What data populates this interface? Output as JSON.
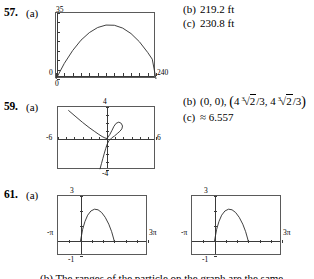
{
  "page": {
    "problems": [
      {
        "number": "57.",
        "part_a_label": "(a)",
        "answers": [
          {
            "label": "(b)",
            "text": "219.2 ft"
          },
          {
            "label": "(c)",
            "text": "230.8 ft"
          }
        ]
      },
      {
        "number": "59.",
        "part_a_label": "(a)",
        "answers": [
          {
            "label": "(b)",
            "prefix": "(0, 0), ",
            "point_open": "(",
            "point_close": ")"
          },
          {
            "label": "(c)",
            "text": "≈ 6.557"
          }
        ],
        "radical_index": "3",
        "radical_radicand": "2",
        "coord_numer": "4",
        "coord_denom": "/3",
        "coord_sep": ", "
      },
      {
        "number": "61.",
        "part_a_label": "(a)"
      }
    ],
    "bottom_note": "(b) The ranges of the particle on the graph are the same."
  },
  "chart_data": [
    {
      "id": "graph-57",
      "type": "line",
      "title": "",
      "xlabel": "",
      "ylabel": "",
      "xlim": [
        0,
        240
      ],
      "ylim": [
        0,
        35
      ],
      "axis_labels": {
        "y_max": "35",
        "y_min": "0",
        "x_min": "0",
        "x_max": "240"
      },
      "grid": false,
      "legend": "none",
      "x_ticks": [
        0,
        20,
        40,
        60,
        80,
        100,
        120,
        140,
        160,
        180,
        200,
        220,
        240
      ],
      "y_ticks": [
        0,
        5,
        10,
        15,
        20,
        25,
        30,
        35
      ],
      "points": [
        {
          "x": 0,
          "y": 0
        },
        {
          "x": 20,
          "y": 8.3
        },
        {
          "x": 40,
          "y": 15.1
        },
        {
          "x": 60,
          "y": 20.6
        },
        {
          "x": 80,
          "y": 24.6
        },
        {
          "x": 100,
          "y": 27.3
        },
        {
          "x": 120,
          "y": 28.6
        },
        {
          "x": 140,
          "y": 28.5
        },
        {
          "x": 160,
          "y": 27.0
        },
        {
          "x": 180,
          "y": 24.1
        },
        {
          "x": 200,
          "y": 19.8
        },
        {
          "x": 220,
          "y": 14.1
        },
        {
          "x": 231,
          "y": 10.5
        },
        {
          "x": 240,
          "y": 0
        }
      ]
    },
    {
      "id": "graph-59",
      "type": "line",
      "title": "",
      "xlabel": "",
      "ylabel": "",
      "xlim": [
        -6,
        6
      ],
      "ylim": [
        -4,
        4
      ],
      "axis_labels": {
        "y_max": "4",
        "y_min": "-4",
        "x_min": "-6",
        "x_max": "6"
      },
      "grid": false,
      "legend": "none",
      "curve_name": "folium of Descartes",
      "branches": [
        {
          "name": "asymptotic-branch",
          "points": [
            {
              "x": -4.7,
              "y": 3.55
            },
            {
              "x": -3.8,
              "y": 2.75
            },
            {
              "x": -3.0,
              "y": 2.05
            },
            {
              "x": -2.2,
              "y": 1.4
            },
            {
              "x": -1.5,
              "y": 0.88
            },
            {
              "x": -1.0,
              "y": 0.52
            },
            {
              "x": -0.6,
              "y": 0.25
            },
            {
              "x": -0.25,
              "y": 0.07
            },
            {
              "x": 0,
              "y": 0
            }
          ]
        },
        {
          "name": "loop-and-tail",
          "points": [
            {
              "x": 0,
              "y": 0
            },
            {
              "x": 0.35,
              "y": 0.52
            },
            {
              "x": 0.62,
              "y": 1.05
            },
            {
              "x": 0.85,
              "y": 1.55
            },
            {
              "x": 1.12,
              "y": 1.93
            },
            {
              "x": 1.45,
              "y": 2.08
            },
            {
              "x": 1.75,
              "y": 1.92
            },
            {
              "x": 1.9,
              "y": 1.58
            },
            {
              "x": 1.82,
              "y": 1.22
            },
            {
              "x": 1.58,
              "y": 0.92
            },
            {
              "x": 1.25,
              "y": 0.62
            },
            {
              "x": 0.92,
              "y": 0.32
            },
            {
              "x": 0.55,
              "y": 0.05
            },
            {
              "x": 0.22,
              "y": -0.3
            },
            {
              "x": 0.02,
              "y": -0.72
            },
            {
              "x": -0.15,
              "y": -1.25
            },
            {
              "x": -0.32,
              "y": -1.85
            },
            {
              "x": -0.5,
              "y": -2.52
            },
            {
              "x": -0.68,
              "y": -3.2
            },
            {
              "x": -0.85,
              "y": -3.85
            }
          ]
        }
      ]
    },
    {
      "id": "graph-61-left",
      "type": "line",
      "title": "",
      "xlabel": "",
      "ylabel": "",
      "xlim": [
        -3.14159,
        9.42478
      ],
      "ylim": [
        -1,
        3
      ],
      "axis_labels": {
        "y_max": "3",
        "y_min": "-1",
        "x_min": "-π",
        "x_max": "3π"
      },
      "grid": false,
      "legend": "none",
      "points": [
        {
          "x": 0.0,
          "y": 0.0
        },
        {
          "x": 0.3,
          "y": 0.78
        },
        {
          "x": 0.62,
          "y": 1.3
        },
        {
          "x": 1.0,
          "y": 1.72
        },
        {
          "x": 1.45,
          "y": 2.0
        },
        {
          "x": 1.95,
          "y": 2.12
        },
        {
          "x": 2.45,
          "y": 2.08
        },
        {
          "x": 2.95,
          "y": 1.9
        },
        {
          "x": 3.45,
          "y": 1.58
        },
        {
          "x": 3.95,
          "y": 1.12
        },
        {
          "x": 4.35,
          "y": 0.62
        },
        {
          "x": 4.6,
          "y": 0.2
        },
        {
          "x": 4.71,
          "y": 0.0
        }
      ]
    },
    {
      "id": "graph-61-right",
      "type": "line",
      "title": "",
      "xlabel": "",
      "ylabel": "",
      "xlim": [
        -3.14159,
        9.42478
      ],
      "ylim": [
        -1,
        3
      ],
      "axis_labels": {
        "y_max": "3",
        "y_min": "-1",
        "x_min": "-π",
        "x_max": "3π"
      },
      "grid": false,
      "legend": "none",
      "points": [
        {
          "x": 0.0,
          "y": 0.0
        },
        {
          "x": 0.3,
          "y": 0.78
        },
        {
          "x": 0.62,
          "y": 1.3
        },
        {
          "x": 1.0,
          "y": 1.72
        },
        {
          "x": 1.45,
          "y": 2.0
        },
        {
          "x": 1.95,
          "y": 2.12
        },
        {
          "x": 2.45,
          "y": 2.08
        },
        {
          "x": 2.95,
          "y": 1.9
        },
        {
          "x": 3.45,
          "y": 1.58
        },
        {
          "x": 3.95,
          "y": 1.12
        },
        {
          "x": 4.35,
          "y": 0.62
        },
        {
          "x": 4.6,
          "y": 0.2
        },
        {
          "x": 4.71,
          "y": 0.0
        }
      ]
    }
  ]
}
